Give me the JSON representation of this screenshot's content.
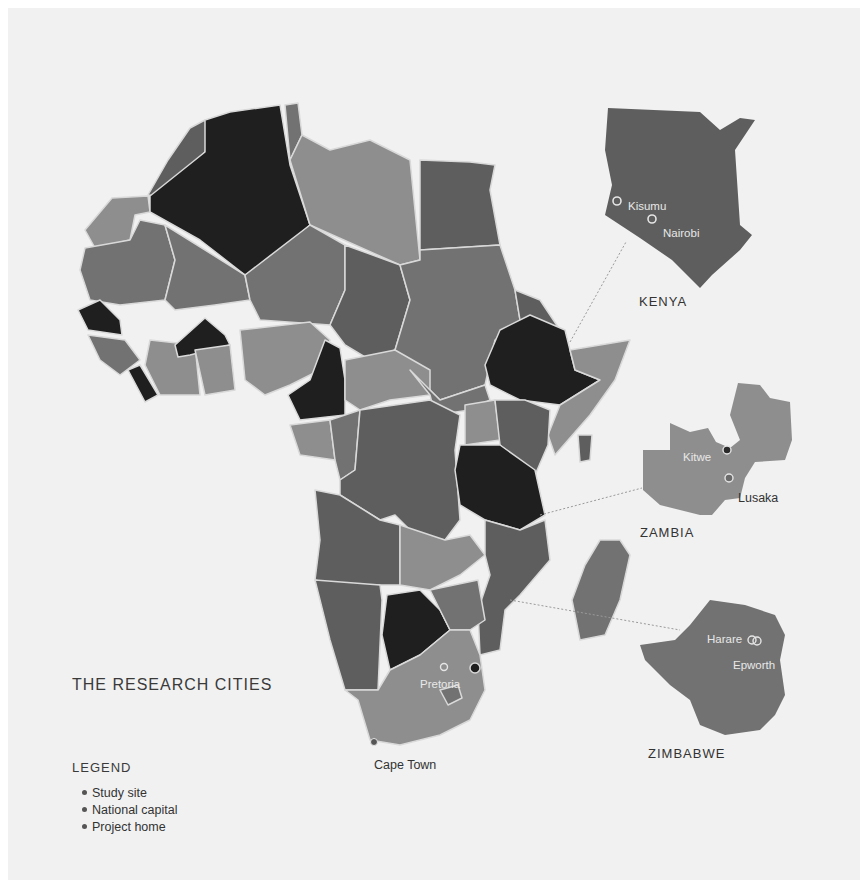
{
  "map": {
    "title": "THE RESEARCH CITIES",
    "palette": {
      "background": "#f1f1f1",
      "dark": "#1f1f1f",
      "mid_dark": "#5e5e5e",
      "mid": "#727272",
      "light": "#8e8e8e",
      "border": "#d9d9d9"
    },
    "insets": [
      {
        "country": "KENYA",
        "cities": [
          {
            "name": "Kisumu",
            "marker": "study-site"
          },
          {
            "name": "Nairobi",
            "marker": "study-site"
          }
        ]
      },
      {
        "country": "ZAMBIA",
        "cities": [
          {
            "name": "Kitwe",
            "marker": "study-site"
          },
          {
            "name": "Lusaka",
            "marker": "national-capital"
          }
        ]
      },
      {
        "country": "ZIMBABWE",
        "cities": [
          {
            "name": "Harare",
            "marker": "study-site"
          },
          {
            "name": "Epworth",
            "marker": "study-site"
          }
        ]
      }
    ],
    "main_cities": [
      {
        "name": "Pretoria",
        "marker": "national-capital"
      },
      {
        "name": "Cape Town",
        "marker": "project-home"
      }
    ]
  },
  "legend": {
    "heading": "LEGEND",
    "items": [
      {
        "label": "Study site"
      },
      {
        "label": "National capital"
      },
      {
        "label": "Project home"
      }
    ]
  }
}
